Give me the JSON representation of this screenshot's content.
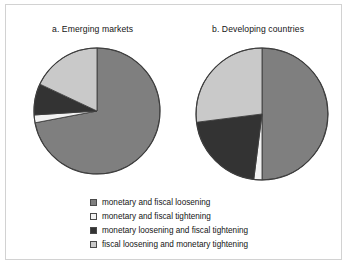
{
  "figure": {
    "background": "#ffffff",
    "border_color": "#d2d2d2"
  },
  "palette": {
    "monetary_and_fiscal_loosening": "#7f7f7f",
    "monetary_and_fiscal_tightening": "#f2f2f2",
    "monetary_loosening_and_fiscal_tightening": "#333333",
    "fiscal_loosening_and_monetary_tightening": "#c9c9c9",
    "slice_outline": "#3d3d3d"
  },
  "legend": {
    "items": [
      {
        "label": "monetary and fiscal loosening",
        "color": "#7f7f7f",
        "swatch_name": "swatch-monetary-and-fiscal-loosening"
      },
      {
        "label": "monetary and fiscal tightening",
        "color": "#f2f2f2",
        "swatch_name": "swatch-monetary-and-fiscal-tightening"
      },
      {
        "label": "monetary loosening and fiscal tightening",
        "color": "#333333",
        "swatch_name": "swatch-monetary-loosening-and-fiscal-tightening"
      },
      {
        "label": "fiscal loosening and monetary tightening",
        "color": "#c9c9c9",
        "swatch_name": "swatch-fiscal-loosening-and-monetary-tightening"
      }
    ]
  },
  "chart_data": [
    {
      "type": "pie",
      "id": "emerging-markets",
      "title": "a.  Emerging markets",
      "categories": [
        "monetary and fiscal loosening",
        "monetary and fiscal tightening",
        "monetary loosening and fiscal tightening",
        "fiscal loosening and monetary tightening"
      ],
      "values": [
        72,
        2,
        8,
        18
      ],
      "units": "percent",
      "start_angle_deg": 0,
      "direction": "clockwise",
      "colors": [
        "#7f7f7f",
        "#f2f2f2",
        "#333333",
        "#c9c9c9"
      ],
      "legend_position": "below",
      "grid": false
    },
    {
      "type": "pie",
      "id": "developing-countries",
      "title": "b.  Developing countries",
      "categories": [
        "monetary and fiscal loosening",
        "monetary and fiscal tightening",
        "monetary loosening and fiscal tightening",
        "fiscal loosening and monetary tightening"
      ],
      "values": [
        50,
        2,
        21,
        27
      ],
      "units": "percent",
      "start_angle_deg": 0,
      "direction": "clockwise",
      "colors": [
        "#7f7f7f",
        "#f2f2f2",
        "#333333",
        "#c9c9c9"
      ],
      "legend_position": "below",
      "grid": false
    }
  ]
}
